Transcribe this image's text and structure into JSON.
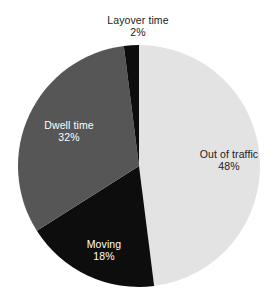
{
  "chart_data": {
    "type": "pie",
    "title": "",
    "xlabel": "",
    "ylabel": "",
    "legend": "none",
    "grid": false,
    "start_angle_deg": 0,
    "direction": "clockwise",
    "categories": [
      "Out of traffic",
      "Moving",
      "Dwell time",
      "Layover time"
    ],
    "values": [
      48,
      18,
      32,
      2
    ],
    "value_unit": "%",
    "colors": [
      "#e3e3e3",
      "#0d0d0d",
      "#565656",
      "#0d0d0d"
    ],
    "slices": [
      {
        "label": "Out of traffic",
        "value": 48,
        "value_text": "48%",
        "color": "#e3e3e3",
        "label_color": "#1a1a1a",
        "label_placement": "inside"
      },
      {
        "label": "Moving",
        "value": 18,
        "value_text": "18%",
        "color": "#0d0d0d",
        "label_color": "#ffffff",
        "label_placement": "inside"
      },
      {
        "label": "Dwell time",
        "value": 32,
        "value_text": "32%",
        "color": "#565656",
        "label_color": "#ffffff",
        "label_placement": "inside"
      },
      {
        "label": "Layover time",
        "value": 2,
        "value_text": "2%",
        "color": "#0d0d0d",
        "label_color": "#1a1a1a",
        "label_placement": "outside-top"
      }
    ],
    "background_color": "#ffffff",
    "geometry": {
      "center_x": 139,
      "center_y": 166,
      "radius": 121
    }
  }
}
